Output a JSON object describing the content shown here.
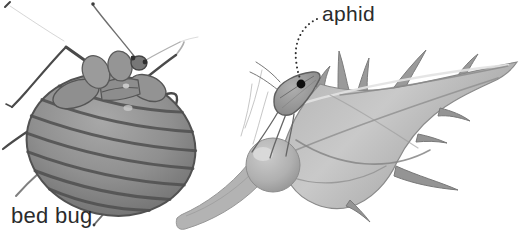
{
  "labels": {
    "aphid": "aphid",
    "bed_bug": "bed bug"
  },
  "colors": {
    "background": "#ffffff",
    "label_ink": "#2b2b2b",
    "leader_line": "#2e2e2e",
    "leader_dot": "#101010",
    "bug_body": "#8f8f8f",
    "bug_segment_line": "#4f4f4f",
    "bug_outline": "#515151",
    "rosebud_light": "#c9c9c9",
    "rosebud_mid": "#aaaaaa",
    "rosebud_dark": "#8a8a8a",
    "stem_gray": "#b3b3b3"
  }
}
